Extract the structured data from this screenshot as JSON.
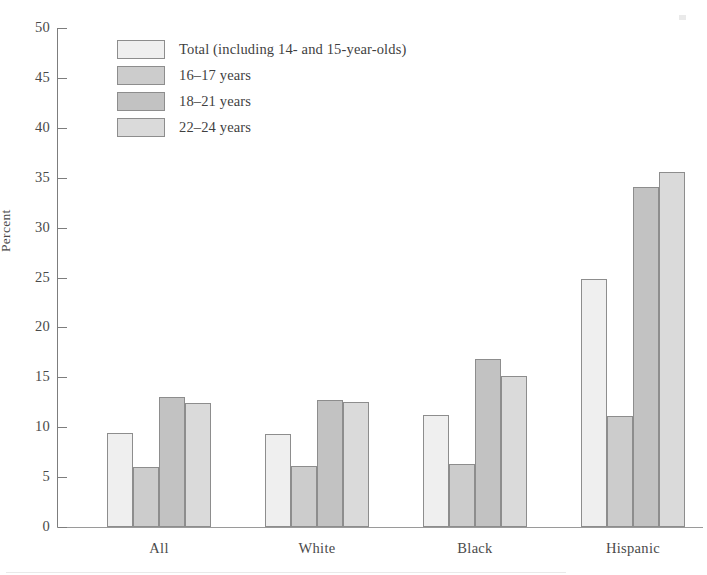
{
  "chart_data": {
    "type": "bar",
    "title": "",
    "subtitle": "",
    "xlabel": "",
    "ylabel": "Percent",
    "ylim": [
      0,
      50
    ],
    "ytick_step": 5,
    "yticks": [
      0,
      5,
      10,
      15,
      20,
      25,
      30,
      35,
      40,
      45,
      50
    ],
    "ytick_labels": [
      "0",
      "5",
      "10",
      "15",
      "20",
      "25",
      "30",
      "35",
      "40",
      "45",
      "50"
    ],
    "grid": false,
    "legend_position": "upper-left-inside",
    "categories": [
      "All",
      "White",
      "Black",
      "Hispanic"
    ],
    "series": [
      {
        "name": "Total (including 14- and 15-year-olds)",
        "color": "#efefef",
        "values": [
          9.4,
          9.3,
          11.2,
          24.9
        ]
      },
      {
        "name": "16–17 years",
        "color": "#cccccc",
        "values": [
          6.0,
          6.1,
          6.3,
          11.1
        ]
      },
      {
        "name": "18–21 years",
        "color": "#c2c2c2",
        "values": [
          13.0,
          12.7,
          16.8,
          34.1
        ]
      },
      {
        "name": "22–24 years",
        "color": "#dadada",
        "values": [
          12.4,
          12.5,
          15.1,
          35.6
        ]
      }
    ],
    "bar_edge_color": "#8d8d8d",
    "axis_color": "#7d7d7d",
    "text_color": "#4a4a4a",
    "background": "#ffffff"
  },
  "legend": {
    "items": [
      {
        "label": "Total (including 14- and 15-year-olds)"
      },
      {
        "label": "16–17 years"
      },
      {
        "label": "18–21 years"
      },
      {
        "label": "22–24 years"
      }
    ]
  },
  "axis": {
    "y_title": "Percent"
  }
}
